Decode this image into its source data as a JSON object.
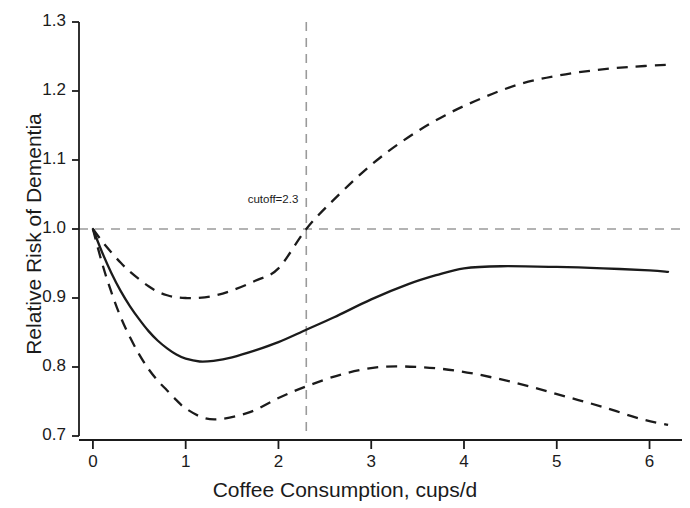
{
  "chart_data": {
    "type": "line",
    "title": "",
    "xlabel": "Coffee Consumption, cups/d",
    "ylabel": "Relative Risk of Dementia",
    "xlim": [
      -0.15,
      6.35
    ],
    "ylim": [
      0.7,
      1.3
    ],
    "xticks": [
      0,
      1,
      2,
      3,
      4,
      5,
      6
    ],
    "xtick_labels": [
      "0",
      "1",
      "2",
      "3",
      "4",
      "5",
      "6"
    ],
    "yticks": [
      0.7,
      0.8,
      0.9,
      1.0,
      1.1,
      1.2,
      1.3
    ],
    "ytick_labels": [
      "0.7",
      "0.8",
      "0.9",
      "1.0",
      "1.1",
      "1.2",
      "1.3"
    ],
    "grid": false,
    "legend": null,
    "reference_lines": [
      {
        "name": "null-risk-line",
        "orientation": "horizontal",
        "value": 1.0,
        "style": "dashed",
        "color": "#9a9a9a"
      },
      {
        "name": "cutoff-line",
        "orientation": "vertical",
        "value": 2.3,
        "style": "dashed",
        "color": "#9a9a9a"
      }
    ],
    "annotations": [
      {
        "name": "cutoff-annotation",
        "text": "cutoff=2.3",
        "x": 2.3,
        "y": 1.032,
        "align": "right"
      }
    ],
    "series": [
      {
        "name": "Relative risk (point estimate)",
        "style": "solid",
        "color": "#1b1b1b",
        "x": [
          0.0,
          0.1,
          0.2,
          0.3,
          0.4,
          0.5,
          0.6,
          0.7,
          0.8,
          0.9,
          1.0,
          1.15,
          1.3,
          1.5,
          1.75,
          2.0,
          2.3,
          2.6,
          3.0,
          3.4,
          3.7,
          4.0,
          4.4,
          5.0,
          5.5,
          6.0,
          6.2
        ],
        "y": [
          1.0,
          0.966,
          0.936,
          0.91,
          0.888,
          0.869,
          0.852,
          0.838,
          0.827,
          0.818,
          0.812,
          0.808,
          0.809,
          0.814,
          0.824,
          0.836,
          0.854,
          0.872,
          0.898,
          0.92,
          0.933,
          0.943,
          0.946,
          0.945,
          0.943,
          0.94,
          0.938
        ]
      },
      {
        "name": "Upper 95% confidence limit",
        "style": "dashed",
        "color": "#1b1b1b",
        "x": [
          0.0,
          0.1,
          0.2,
          0.3,
          0.4,
          0.5,
          0.6,
          0.7,
          0.8,
          0.9,
          1.0,
          1.13,
          1.3,
          1.5,
          1.75,
          2.0,
          2.3,
          2.6,
          3.0,
          3.4,
          3.8,
          4.2,
          4.6,
          5.0,
          5.4,
          5.8,
          6.2
        ],
        "y": [
          1.0,
          0.982,
          0.966,
          0.951,
          0.938,
          0.927,
          0.917,
          0.909,
          0.904,
          0.901,
          0.9,
          0.9,
          0.903,
          0.911,
          0.925,
          0.943,
          1.0,
          1.043,
          1.093,
          1.133,
          1.165,
          1.19,
          1.21,
          1.222,
          1.23,
          1.235,
          1.238
        ]
      },
      {
        "name": "Lower 95% confidence limit",
        "style": "dashed",
        "color": "#1b1b1b",
        "x": [
          0.0,
          0.1,
          0.2,
          0.3,
          0.4,
          0.5,
          0.6,
          0.7,
          0.8,
          0.9,
          1.0,
          1.2,
          1.4,
          1.7,
          2.0,
          2.3,
          2.7,
          3.1,
          3.5,
          3.9,
          4.3,
          4.7,
          5.1,
          5.5,
          5.9,
          6.2
        ],
        "y": [
          1.0,
          0.95,
          0.908,
          0.872,
          0.843,
          0.818,
          0.797,
          0.78,
          0.766,
          0.752,
          0.74,
          0.726,
          0.725,
          0.735,
          0.755,
          0.772,
          0.79,
          0.8,
          0.8,
          0.795,
          0.785,
          0.772,
          0.757,
          0.742,
          0.725,
          0.716
        ]
      }
    ]
  },
  "axes": {
    "x_title": "Coffee Consumption, cups/d",
    "y_title": "Relative Risk of Dementia",
    "x_tick_labels": [
      "0",
      "1",
      "2",
      "3",
      "4",
      "5",
      "6"
    ],
    "y_tick_labels": [
      "0.7",
      "0.8",
      "0.9",
      "1.0",
      "1.1",
      "1.2",
      "1.3"
    ]
  },
  "annotations": {
    "cutoff": "cutoff=2.3"
  },
  "colors": {
    "curve": "#1b1b1b",
    "reference": "#9a9a9a",
    "axis": "#1b1b1b",
    "background": "#ffffff"
  }
}
